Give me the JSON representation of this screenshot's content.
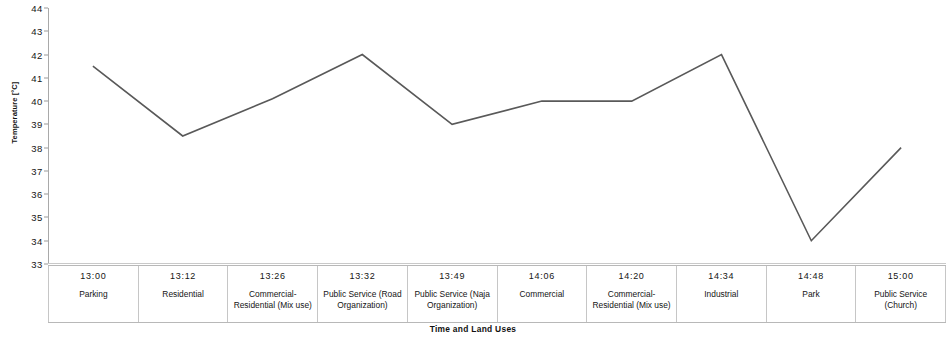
{
  "chart_data": {
    "type": "line",
    "title": "",
    "xlabel": "Time and Land Uses",
    "ylabel": "Temperature [°C]",
    "ylim": [
      33,
      44
    ],
    "y_ticks": [
      44,
      43,
      42,
      41,
      40,
      39,
      38,
      37,
      36,
      35,
      34,
      33
    ],
    "grid": false,
    "legend": "none",
    "line_color": "#595959",
    "categories": [
      "Parking",
      "Residential",
      "Commercial-Residential (Mix use)",
      "Public Service (Road Organization)",
      "Public Service (Naja Organization)",
      "Commercial",
      "Commercial-Residential (Mix use)",
      "Industrial",
      "Park",
      "Public Service (Church)"
    ],
    "times": [
      "13:00",
      "13:12",
      "13:26",
      "13:32",
      "13:49",
      "14:06",
      "14:20",
      "14:34",
      "14:48",
      "15:00"
    ],
    "values": [
      41.5,
      38.5,
      40.1,
      42.0,
      39.0,
      40.0,
      40.0,
      42.0,
      34.0,
      38.0
    ],
    "series": [
      {
        "name": "Temperature",
        "values": [
          41.5,
          38.5,
          40.1,
          42.0,
          39.0,
          40.0,
          40.0,
          42.0,
          34.0,
          38.0
        ]
      }
    ]
  }
}
